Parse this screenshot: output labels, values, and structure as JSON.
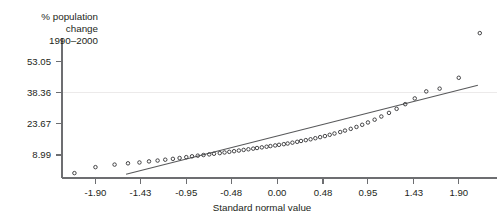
{
  "chart_data": {
    "type": "scatter",
    "title": "",
    "xlabel": "Standard normal value",
    "ylabel": "% population change 1990–2000",
    "ylabel_lines": [
      "% population",
      "change",
      "1990–2000"
    ],
    "grid": "single horizontal gridline at y = 38.36",
    "legend": "none",
    "xticklabels": [
      "-1.90",
      "-1.43",
      "-0.95",
      "-0.48",
      "0.00",
      "0.48",
      "0.95",
      "1.43",
      "1.90"
    ],
    "xtickvalues": [
      -1.9,
      -1.43,
      -0.95,
      -0.48,
      0.0,
      0.48,
      0.95,
      1.43,
      1.9
    ],
    "yticklabels": [
      "8.99",
      "23.67",
      "38.36",
      "53.05"
    ],
    "ytickvalues": [
      8.99,
      23.67,
      38.36,
      53.05
    ],
    "xlim": [
      -2.25,
      2.3
    ],
    "ylim": [
      -1.8,
      64.0
    ],
    "series": [
      {
        "name": "state % population change vs standard normal value",
        "marker": "open-circle",
        "x": [
          -2.12,
          -1.9,
          -1.7,
          -1.56,
          -1.44,
          -1.34,
          -1.25,
          -1.17,
          -1.09,
          -1.02,
          -0.95,
          -0.89,
          -0.83,
          -0.77,
          -0.71,
          -0.66,
          -0.6,
          -0.55,
          -0.5,
          -0.45,
          -0.4,
          -0.35,
          -0.3,
          -0.25,
          -0.21,
          -0.16,
          -0.11,
          -0.07,
          -0.02,
          0.02,
          0.07,
          0.11,
          0.16,
          0.21,
          0.25,
          0.3,
          0.35,
          0.4,
          0.45,
          0.5,
          0.55,
          0.6,
          0.66,
          0.71,
          0.77,
          0.83,
          0.89,
          0.95,
          1.02,
          1.09,
          1.17,
          1.25,
          1.34,
          1.44,
          1.56,
          1.7,
          1.9,
          2.12
        ],
        "y": [
          0.5,
          3.3,
          4.5,
          5.1,
          5.5,
          6.0,
          6.4,
          6.8,
          7.2,
          7.6,
          8.0,
          8.4,
          8.7,
          9.0,
          9.3,
          9.6,
          9.9,
          10.2,
          10.5,
          10.8,
          11.1,
          11.4,
          11.7,
          12.0,
          12.3,
          12.6,
          12.9,
          13.2,
          13.5,
          13.8,
          14.1,
          14.4,
          14.8,
          15.2,
          15.6,
          16.0,
          16.4,
          16.9,
          17.4,
          17.9,
          18.5,
          19.1,
          19.8,
          20.5,
          21.3,
          22.2,
          23.2,
          24.3,
          25.6,
          27.1,
          28.8,
          30.7,
          32.9,
          35.6,
          38.9,
          40.2,
          45.3,
          66.3
        ]
      }
    ],
    "reference_line": {
      "name": "normal reference line",
      "x_start": -1.58,
      "y_start": 0.0,
      "x_end": 2.1,
      "y_end": 41.8
    }
  }
}
